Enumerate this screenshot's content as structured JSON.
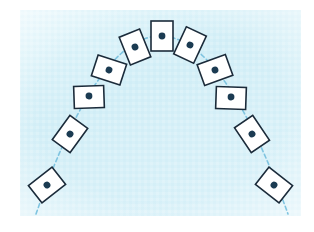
{
  "figure": {
    "canvas": {
      "width": 314,
      "height": 232
    },
    "panel": {
      "name": "background-panel",
      "x": 20,
      "y": 10,
      "width": 281,
      "height": 206,
      "fill_color": "#d6f0f7",
      "fill_color_light": "#e8f7fb",
      "texture": "subtle mottled halftone"
    },
    "trajectory": {
      "name": "parabolic-path",
      "style": "dashed",
      "color": "#7fc4e0",
      "stroke_width": 1.6,
      "dash": "4 3",
      "shape": "parabola",
      "apex_x": 160,
      "apex_y": 36,
      "start_point": [
        36,
        214
      ],
      "end_point": [
        288,
        214
      ]
    },
    "card_style": {
      "fill_color": "#ffffff",
      "border_color": "#1b2b3a",
      "border_width": 1.6,
      "dot_color": "#1b3b52",
      "dot_radius": 3.4,
      "card_width": 22,
      "card_height": 30
    },
    "cards": [
      {
        "id": 1,
        "name": "card-1-launch-left",
        "cx": 47,
        "cy": 185,
        "rotation": 52,
        "w": 22,
        "h": 30,
        "dot_dx": 0,
        "dot_dy": 0
      },
      {
        "id": 2,
        "name": "card-2-ascending-left",
        "cx": 70,
        "cy": 134,
        "rotation": 36,
        "w": 22,
        "h": 30,
        "dot_dx": 0,
        "dot_dy": 0
      },
      {
        "id": 3,
        "name": "card-3-ascending-left",
        "cx": 89,
        "cy": 97,
        "rotation": 88,
        "w": 22,
        "h": 30,
        "dot_dx": -1,
        "dot_dy": 0
      },
      {
        "id": 4,
        "name": "card-4-ascending-left",
        "cx": 109,
        "cy": 70,
        "rotation": 108,
        "w": 22,
        "h": 30,
        "dot_dx": 0,
        "dot_dy": 0
      },
      {
        "id": 5,
        "name": "card-5-near-apex-left",
        "cx": 135,
        "cy": 47,
        "rotation": 158,
        "w": 22,
        "h": 30,
        "dot_dx": 0,
        "dot_dy": 0
      },
      {
        "id": 6,
        "name": "card-6-apex",
        "cx": 162,
        "cy": 36,
        "rotation": 180,
        "w": 22,
        "h": 30,
        "dot_dx": 0,
        "dot_dy": 0
      },
      {
        "id": 7,
        "name": "card-7-near-apex-right",
        "cx": 190,
        "cy": 45,
        "rotation": 205,
        "w": 22,
        "h": 30,
        "dot_dx": 0,
        "dot_dy": 0
      },
      {
        "id": 8,
        "name": "card-8-descending-right",
        "cx": 215,
        "cy": 70,
        "rotation": 250,
        "w": 22,
        "h": 30,
        "dot_dx": 0,
        "dot_dy": 0
      },
      {
        "id": 9,
        "name": "card-9-descending-right",
        "cx": 231,
        "cy": 98,
        "rotation": 272,
        "w": 22,
        "h": 30,
        "dot_dx": 1,
        "dot_dy": 0
      },
      {
        "id": 10,
        "name": "card-10-descending-right",
        "cx": 252,
        "cy": 134,
        "rotation": 326,
        "w": 22,
        "h": 30,
        "dot_dx": 0,
        "dot_dy": 0
      },
      {
        "id": 11,
        "name": "card-11-landing-right",
        "cx": 274,
        "cy": 185,
        "rotation": 308,
        "w": 22,
        "h": 30,
        "dot_dx": 0,
        "dot_dy": 0
      }
    ]
  }
}
